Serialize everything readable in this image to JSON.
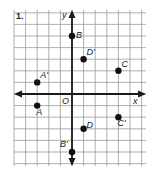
{
  "problem_number": "1.",
  "axes": {
    "x_label": "x",
    "y_label": "y",
    "origin_label": "O"
  },
  "grid": {
    "x_min": -5,
    "x_max": 6,
    "y_min": -6,
    "y_max": 7,
    "unit": 1
  },
  "points": [
    {
      "name": "B",
      "x": 0,
      "y": 5
    },
    {
      "name": "D'",
      "x": 1,
      "y": 3
    },
    {
      "name": "C",
      "x": 4,
      "y": 2
    },
    {
      "name": "A'",
      "x": -3,
      "y": 1
    },
    {
      "name": "A",
      "x": -3,
      "y": -1
    },
    {
      "name": "D",
      "x": 1,
      "y": -3
    },
    {
      "name": "C'",
      "x": 4,
      "y": -2
    },
    {
      "name": "B'",
      "x": 0,
      "y": -5
    }
  ],
  "colors": {
    "grid": "#9a9a9a",
    "axis": "#1a1a1a",
    "point": "#111111"
  }
}
